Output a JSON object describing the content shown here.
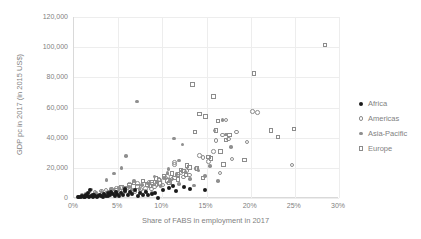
{
  "chart_data": {
    "type": "scatter",
    "title": "",
    "xlabel": "Share of FABS in employment in 2017",
    "ylabel": "GDP pc in 2017 (in 2015 US$)",
    "xlim": [
      0,
      0.3
    ],
    "ylim": [
      0,
      120000
    ],
    "xticklabels": [
      "0%",
      "5%",
      "10%",
      "15%",
      "20%",
      "25%",
      "30%"
    ],
    "xtickvalues": [
      0,
      0.05,
      0.1,
      0.15,
      0.2,
      0.25,
      0.3
    ],
    "yticklabels": [
      "0",
      "20,000",
      "40,000",
      "60,000",
      "80,000",
      "100,000",
      "120,000"
    ],
    "ytickvalues": [
      0,
      20000,
      40000,
      60000,
      80000,
      100000,
      120000
    ],
    "grid": true,
    "grid_color": "#ededed",
    "legend_position": "right",
    "legend_entries": [
      "Africa",
      "Americas",
      "Asia-Pacific",
      "Europe"
    ],
    "series": [
      {
        "name": "Africa",
        "marker": "filled-circle",
        "color": "#1a1a1a",
        "points": [
          [
            0.004,
            600
          ],
          [
            0.006,
            900
          ],
          [
            0.008,
            500
          ],
          [
            0.009,
            1200
          ],
          [
            0.011,
            800
          ],
          [
            0.012,
            1500
          ],
          [
            0.013,
            700
          ],
          [
            0.014,
            2000
          ],
          [
            0.015,
            1100
          ],
          [
            0.016,
            3500
          ],
          [
            0.017,
            900
          ],
          [
            0.018,
            5200
          ],
          [
            0.019,
            1400
          ],
          [
            0.021,
            2300
          ],
          [
            0.022,
            800
          ],
          [
            0.023,
            1800
          ],
          [
            0.024,
            1100
          ],
          [
            0.026,
            600
          ],
          [
            0.027,
            1600
          ],
          [
            0.029,
            2100
          ],
          [
            0.031,
            1300
          ],
          [
            0.033,
            900
          ],
          [
            0.034,
            2600
          ],
          [
            0.036,
            1500
          ],
          [
            0.038,
            3100
          ],
          [
            0.039,
            1000
          ],
          [
            0.041,
            1900
          ],
          [
            0.042,
            3800
          ],
          [
            0.044,
            2400
          ],
          [
            0.046,
            1200
          ],
          [
            0.047,
            4100
          ],
          [
            0.049,
            2800
          ],
          [
            0.051,
            1600
          ],
          [
            0.053,
            3300
          ],
          [
            0.055,
            2200
          ],
          [
            0.058,
            4600
          ],
          [
            0.061,
            1800
          ],
          [
            0.063,
            3700
          ],
          [
            0.066,
            2500
          ],
          [
            0.069,
            5100
          ],
          [
            0.072,
            1400
          ],
          [
            0.075,
            3000
          ],
          [
            0.078,
            2000
          ],
          [
            0.081,
            4300
          ],
          [
            0.084,
            1700
          ],
          [
            0.088,
            2700
          ],
          [
            0.092,
            3400
          ],
          [
            0.095,
            300
          ],
          [
            0.101,
            5400
          ],
          [
            0.108,
            6800
          ],
          [
            0.115,
            4900
          ],
          [
            0.124,
            7200
          ],
          [
            0.131,
            5900
          ],
          [
            0.148,
            5300
          ],
          [
            0.112,
            8100
          ],
          [
            0.058,
            6200
          ]
        ]
      },
      {
        "name": "Americas",
        "marker": "open-circle",
        "color": "#8c8c8c",
        "points": [
          [
            0.018,
            2400
          ],
          [
            0.024,
            3800
          ],
          [
            0.031,
            4600
          ],
          [
            0.036,
            5200
          ],
          [
            0.041,
            3300
          ],
          [
            0.043,
            5800
          ],
          [
            0.046,
            4100
          ],
          [
            0.048,
            6400
          ],
          [
            0.051,
            3600
          ],
          [
            0.053,
            7100
          ],
          [
            0.056,
            4800
          ],
          [
            0.058,
            5500
          ],
          [
            0.061,
            4200
          ],
          [
            0.063,
            8900
          ],
          [
            0.066,
            5100
          ],
          [
            0.069,
            3900
          ],
          [
            0.072,
            9700
          ],
          [
            0.075,
            5600
          ],
          [
            0.078,
            4400
          ],
          [
            0.081,
            6200
          ],
          [
            0.085,
            10300
          ],
          [
            0.088,
            5900
          ],
          [
            0.091,
            7400
          ],
          [
            0.094,
            9100
          ],
          [
            0.097,
            11800
          ],
          [
            0.101,
            8600
          ],
          [
            0.104,
            13200
          ],
          [
            0.107,
            10100
          ],
          [
            0.111,
            12600
          ],
          [
            0.114,
            23400
          ],
          [
            0.114,
            22100
          ],
          [
            0.117,
            14700
          ],
          [
            0.121,
            16900
          ],
          [
            0.124,
            13800
          ],
          [
            0.128,
            18200
          ],
          [
            0.131,
            15300
          ],
          [
            0.138,
            19600
          ],
          [
            0.142,
            28300
          ],
          [
            0.146,
            26800
          ],
          [
            0.152,
            24100
          ],
          [
            0.158,
            30700
          ],
          [
            0.161,
            38200
          ],
          [
            0.165,
            16500
          ],
          [
            0.168,
            41800
          ],
          [
            0.172,
            51800
          ],
          [
            0.175,
            39100
          ],
          [
            0.179,
            25800
          ],
          [
            0.184,
            43700
          ],
          [
            0.196,
            37100
          ],
          [
            0.202,
            57200
          ],
          [
            0.208,
            56800
          ],
          [
            0.247,
            22000
          ],
          [
            0.096,
            12200
          ],
          [
            0.089,
            9400
          ],
          [
            0.106,
            14100
          ]
        ]
      },
      {
        "name": "Asia-Pacific",
        "marker": "small-filled-circle",
        "color": "#8f8f8f",
        "points": [
          [
            0.009,
            1800
          ],
          [
            0.013,
            2900
          ],
          [
            0.016,
            1400
          ],
          [
            0.019,
            5600
          ],
          [
            0.022,
            2200
          ],
          [
            0.025,
            3400
          ],
          [
            0.028,
            1900
          ],
          [
            0.031,
            4200
          ],
          [
            0.034,
            2700
          ],
          [
            0.037,
            12100
          ],
          [
            0.039,
            3100
          ],
          [
            0.042,
            5900
          ],
          [
            0.045,
            16200
          ],
          [
            0.047,
            4400
          ],
          [
            0.051,
            6700
          ],
          [
            0.054,
            19800
          ],
          [
            0.057,
            3800
          ],
          [
            0.059,
            27900
          ],
          [
            0.062,
            7300
          ],
          [
            0.065,
            5200
          ],
          [
            0.068,
            11400
          ],
          [
            0.071,
            63900
          ],
          [
            0.074,
            6100
          ],
          [
            0.077,
            8800
          ],
          [
            0.081,
            4700
          ],
          [
            0.084,
            9600
          ],
          [
            0.088,
            3300
          ],
          [
            0.091,
            14300
          ],
          [
            0.094,
            10800
          ],
          [
            0.098,
            7900
          ],
          [
            0.102,
            13100
          ],
          [
            0.106,
            16400
          ],
          [
            0.109,
            11900
          ],
          [
            0.113,
            39400
          ],
          [
            0.116,
            15800
          ],
          [
            0.119,
            9200
          ],
          [
            0.123,
            35600
          ],
          [
            0.126,
            17300
          ],
          [
            0.131,
            12400
          ],
          [
            0.136,
            8400
          ],
          [
            0.141,
            18100
          ],
          [
            0.148,
            14600
          ],
          [
            0.154,
            21300
          ],
          [
            0.159,
            44800
          ],
          [
            0.163,
            11200
          ],
          [
            0.168,
            51900
          ],
          [
            0.172,
            42100
          ],
          [
            0.178,
            33700
          ],
          [
            0.119,
            24900
          ],
          [
            0.107,
            19100
          ]
        ]
      },
      {
        "name": "Europe",
        "marker": "open-square",
        "color": "#8c8c8c",
        "points": [
          [
            0.041,
            3900
          ],
          [
            0.048,
            5400
          ],
          [
            0.054,
            7100
          ],
          [
            0.058,
            6300
          ],
          [
            0.063,
            8200
          ],
          [
            0.068,
            9900
          ],
          [
            0.072,
            7600
          ],
          [
            0.078,
            11200
          ],
          [
            0.083,
            8800
          ],
          [
            0.088,
            10400
          ],
          [
            0.093,
            12900
          ],
          [
            0.097,
            9600
          ],
          [
            0.102,
            14100
          ],
          [
            0.106,
            11700
          ],
          [
            0.111,
            16300
          ],
          [
            0.114,
            13400
          ],
          [
            0.118,
            12200
          ],
          [
            0.121,
            18600
          ],
          [
            0.124,
            17800
          ],
          [
            0.127,
            15100
          ],
          [
            0.131,
            20200
          ],
          [
            0.134,
            75300
          ],
          [
            0.137,
            43600
          ],
          [
            0.139,
            19400
          ],
          [
            0.142,
            55700
          ],
          [
            0.146,
            13100
          ],
          [
            0.149,
            53900
          ],
          [
            0.152,
            27100
          ],
          [
            0.155,
            26300
          ],
          [
            0.158,
            67200
          ],
          [
            0.161,
            44700
          ],
          [
            0.163,
            51200
          ],
          [
            0.166,
            30800
          ],
          [
            0.169,
            22100
          ],
          [
            0.172,
            38300
          ],
          [
            0.176,
            41900
          ],
          [
            0.193,
            25200
          ],
          [
            0.204,
            82600
          ],
          [
            0.223,
            44600
          ],
          [
            0.231,
            40500
          ],
          [
            0.249,
            45700
          ],
          [
            0.284,
            101600
          ],
          [
            0.108,
            10100
          ],
          [
            0.086,
            7900
          ],
          [
            0.128,
            21400
          ],
          [
            0.118,
            15700
          ]
        ]
      }
    ]
  },
  "axis": {
    "x_title": "Share of FABS in employment in 2017",
    "y_title": "GDP pc in 2017 (in 2015 US$)"
  },
  "legend": {
    "items": [
      {
        "label": "Africa",
        "key": "africa"
      },
      {
        "label": "Americas",
        "key": "americas"
      },
      {
        "label": "Asia-Pacific",
        "key": "asiapacific"
      },
      {
        "label": "Europe",
        "key": "europe"
      }
    ]
  },
  "colors": {
    "africa": "#1a1a1a",
    "americas": "#8c8c8c",
    "asiapacific": "#8f8f8f",
    "europe": "#8c8c8c",
    "grid": "#ededed",
    "axis": "#d9d9d9",
    "text": "#7f7f7f"
  }
}
